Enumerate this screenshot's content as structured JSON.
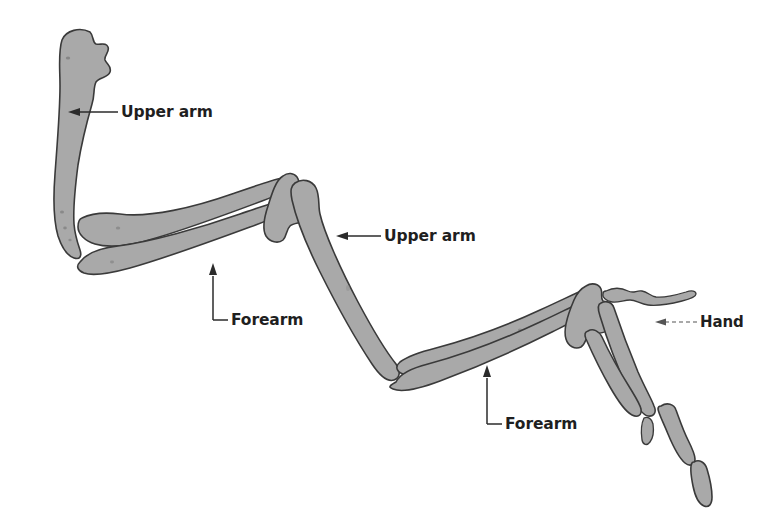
{
  "figure": {
    "type": "anatomical-diagram",
    "background_color": "#ffffff",
    "bone_fill_color": "#a9a9a9",
    "bone_outline_color": "#3a3a3a",
    "label_color": "#1f1f1f"
  },
  "labels": [
    {
      "id": "upper-arm-left",
      "text": "Upper arm",
      "leader_style": "horizontal-arrow-left"
    },
    {
      "id": "forearm-left",
      "text": "Forearm",
      "leader_style": "elbow-arrow-up"
    },
    {
      "id": "upper-arm-right",
      "text": "Upper arm",
      "leader_style": "horizontal-arrow-left"
    },
    {
      "id": "forearm-right",
      "text": "Forearm",
      "leader_style": "elbow-arrow-up"
    },
    {
      "id": "hand",
      "text": "Hand",
      "leader_style": "horizontal-arrow-left-dashed"
    }
  ]
}
